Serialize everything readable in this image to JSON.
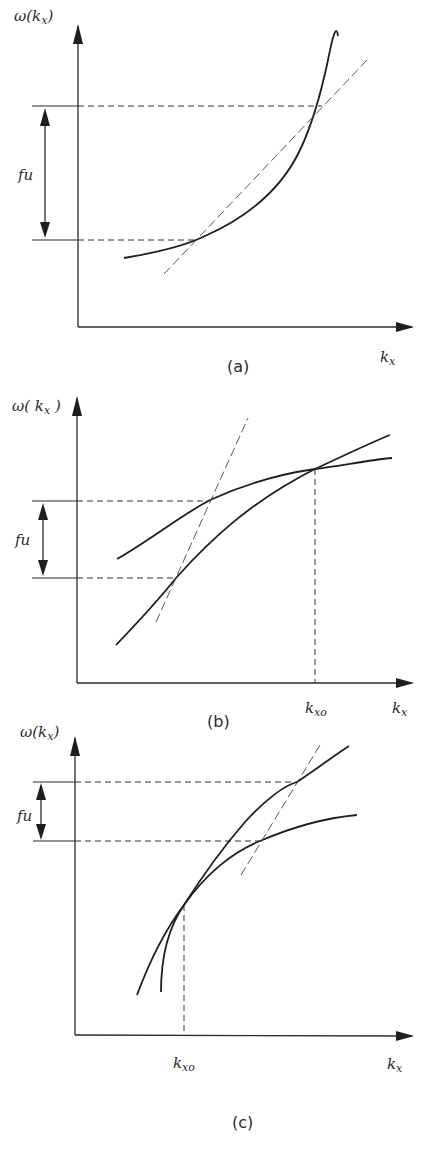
{
  "figure": {
    "panels": [
      {
        "id": "a",
        "caption": "(a)",
        "y_label": "ω(kx)",
        "y_label_main": "ω(k",
        "y_label_sub": "x",
        "y_label_close": ")",
        "x_label_main": "k",
        "x_label_sub": "x",
        "interval_label": "fu",
        "description": "Convex increasing dispersion curve with a dashed secant line intersecting it at two points separated vertically by fu"
      },
      {
        "id": "b",
        "caption": "(b)",
        "y_label_main": "ω( k",
        "y_label_sub": "x",
        "y_label_close": " )",
        "x_label_main": "k",
        "x_label_sub": "x",
        "marker_main": "k",
        "marker_sub": "xo",
        "interval_label": "fu",
        "description": "Two concave curves crossing at kxo; dashed line intersects both curves, separated vertically by fu"
      },
      {
        "id": "c",
        "caption": "(c)",
        "y_label_main": "ω(k",
        "y_label_sub": "x",
        "y_label_close": ")",
        "x_label_main": "k",
        "x_label_sub": "x",
        "marker_main": "k",
        "marker_sub": "xo",
        "interval_label": "fu",
        "description": "Two concave curves tangent at kxo; dashed line intersects both curves, separated vertically by fu"
      }
    ]
  }
}
